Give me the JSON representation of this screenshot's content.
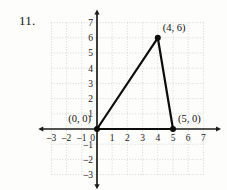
{
  "problem": {
    "number": "11."
  },
  "colors": {
    "background": "#fdfdfc",
    "grid": "#c9c9c4",
    "axis": "#1b1b1b",
    "shape_stroke": "#0d0d0d",
    "label_text": "#111111"
  },
  "chart_data": {
    "type": "scatter",
    "title": "",
    "subtitle": "",
    "xlabel": "",
    "ylabel": "",
    "xlim": [
      -3.6,
      7.9
    ],
    "ylim": [
      -3.7,
      7.6
    ],
    "grid": true,
    "grid_style": "dotted",
    "legend": null,
    "legend_position": "none",
    "x_ticks": [
      -3,
      -2,
      -1,
      0,
      1,
      2,
      3,
      4,
      5,
      6,
      7
    ],
    "x_tick_labels": [
      "-3",
      "-2",
      "-1",
      "0",
      "1",
      "2",
      "3",
      "4",
      "5",
      "6",
      "7"
    ],
    "y_ticks": [
      7,
      6,
      5,
      4,
      3,
      2,
      1,
      -1,
      -2,
      -3
    ],
    "y_tick_labels": [
      "7",
      "6",
      "5",
      "4",
      "3",
      "2",
      "1",
      "-1",
      "-2",
      "-3"
    ],
    "origin_label": "0",
    "shapes": [
      {
        "kind": "triangle",
        "closed": true,
        "vertices": [
          {
            "x": 0,
            "y": 0,
            "label": "(0, 0)"
          },
          {
            "x": 4,
            "y": 6,
            "label": "(4, 6)"
          },
          {
            "x": 5,
            "y": 0,
            "label": "(5, 0)"
          }
        ]
      }
    ],
    "annotations": [
      {
        "text": "(0, 0)",
        "x": 0,
        "y": 0,
        "anchor": "left"
      },
      {
        "text": "(4, 6)",
        "x": 4,
        "y": 6,
        "anchor": "upper-right"
      },
      {
        "text": "(5, 0)",
        "x": 5,
        "y": 0,
        "anchor": "right"
      }
    ]
  }
}
